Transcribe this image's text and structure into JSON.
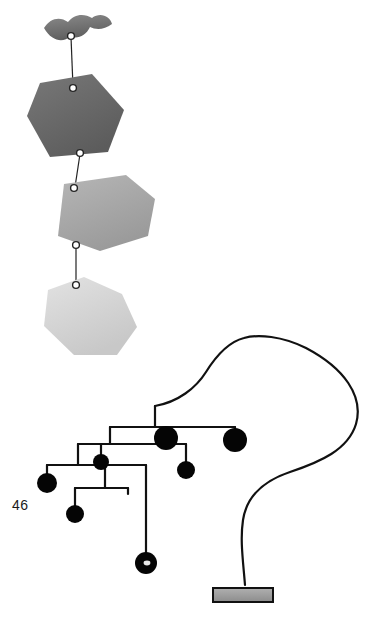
{
  "page": {
    "page_number": "46",
    "background_color": "#ffffff",
    "width": 391,
    "height": 621
  },
  "artworks": [
    {
      "id": "hanging-mobile",
      "name": "hanging-mobile-with-stacked-plates",
      "description": "Vertical hanging mobile of four irregular polygon plates joined by thin wires with small ring connectors",
      "elements": [
        {
          "name": "top-winged-plate",
          "shape": "winged-arc",
          "fill": "#6e6e6e",
          "cx": 77,
          "cy": 32
        },
        {
          "name": "upper-pentagon-plate",
          "shape": "pentagon",
          "fill": "#6a6a6a",
          "cx": 76,
          "cy": 120
        },
        {
          "name": "middle-hexagon-plate",
          "shape": "hexagon",
          "fill": "#a8a8a8",
          "cx": 101,
          "cy": 213
        },
        {
          "name": "lower-heptagon-plate",
          "shape": "heptagon",
          "fill": "#d6d6d6",
          "cx": 86,
          "cy": 312
        }
      ],
      "connectors": [
        {
          "name": "ring-connector-top",
          "cx": 71,
          "cy": 36
        },
        {
          "name": "ring-connector-upper",
          "cx": 73,
          "cy": 88
        },
        {
          "name": "ring-connector-mid",
          "cx": 80,
          "cy": 153
        },
        {
          "name": "ring-connector-lower-a",
          "cx": 74,
          "cy": 188
        },
        {
          "name": "ring-connector-lower-b",
          "cx": 76,
          "cy": 245
        },
        {
          "name": "ring-connector-bottom",
          "cx": 76,
          "cy": 285
        }
      ]
    },
    {
      "id": "standing-mobile",
      "name": "standing-mobile-on-base",
      "description": "Standing wire mobile with a tall looping arm and branching horizontal wires holding black discs, mounted on a small grey rectangular base",
      "stroke_color": "#111111",
      "disc_color": "#050505",
      "base": {
        "name": "mobile-base-block",
        "fill": "#9b9b9b",
        "x": 213,
        "y": 585,
        "width": 60,
        "height": 18
      },
      "discs": [
        {
          "name": "disc-large-upper",
          "cx": 166,
          "cy": 438,
          "r": 12
        },
        {
          "name": "disc-large-right",
          "cx": 235,
          "cy": 440,
          "r": 12
        },
        {
          "name": "disc-left-outer",
          "cx": 47,
          "cy": 483,
          "r": 10
        },
        {
          "name": "disc-mid-small",
          "cx": 101,
          "cy": 462,
          "r": 8
        },
        {
          "name": "disc-right-small",
          "cx": 186,
          "cy": 470,
          "r": 9
        },
        {
          "name": "disc-lower-left",
          "cx": 75,
          "cy": 514,
          "r": 9
        },
        {
          "name": "disc-ringed-bottom",
          "cx": 146,
          "cy": 563,
          "r": 11
        }
      ]
    }
  ]
}
